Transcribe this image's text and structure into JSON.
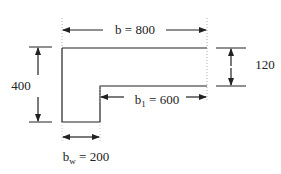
{
  "diagram": {
    "type": "T-beam cross-section",
    "colors": {
      "line": "#222222",
      "dotted": "#999999",
      "background": "#ffffff"
    },
    "labels": {
      "flange_width": {
        "symbol": "b",
        "subscript": "",
        "eq": " = ",
        "value": "800"
      },
      "total_depth": {
        "value": "400"
      },
      "flange_depth": {
        "value": "120"
      },
      "overhang_width": {
        "symbol": "b",
        "subscript": "1",
        "eq": " = ",
        "value": "600"
      },
      "web_width": {
        "symbol": "b",
        "subscript": "w",
        "eq": " = ",
        "value": "200"
      }
    }
  }
}
